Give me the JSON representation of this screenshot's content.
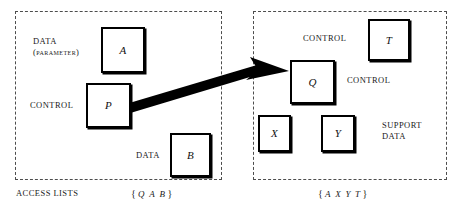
{
  "figure": {
    "title": "",
    "background_color": "#ffffff",
    "line_color": "#000000",
    "panel_border_color": "#4d4d4d",
    "arrow_color": "#000000"
  },
  "panels": [
    {
      "id": "left-domain",
      "footer_label": "ACCESS LISTS",
      "set_braces": {
        "open": "{",
        "close": "}"
      },
      "set_members": [
        "Q",
        "A",
        "B"
      ],
      "captions": [
        {
          "id": "data-parameter",
          "text": "DATA\n(parameter)"
        },
        {
          "id": "control-left",
          "text": "CONTROL"
        },
        {
          "id": "data-left",
          "text": "DATA"
        }
      ],
      "boxes": [
        {
          "id": "box-a",
          "label": "A"
        },
        {
          "id": "box-p",
          "label": "P"
        },
        {
          "id": "box-b",
          "label": "B"
        }
      ]
    },
    {
      "id": "right-domain",
      "footer_label": "",
      "set_braces": {
        "open": "{",
        "close": "}"
      },
      "set_members": [
        "A",
        "X",
        "Y",
        "T"
      ],
      "captions": [
        {
          "id": "control-top-right",
          "text": "CONTROL"
        },
        {
          "id": "control-mid-right",
          "text": "CONTROL"
        },
        {
          "id": "support-data",
          "text": "SUPPORT\nDATA"
        }
      ],
      "boxes": [
        {
          "id": "box-t",
          "label": "T"
        },
        {
          "id": "box-q",
          "label": "Q"
        },
        {
          "id": "box-x",
          "label": "X"
        },
        {
          "id": "box-y",
          "label": "Y"
        }
      ]
    }
  ],
  "arrow": {
    "id": "transfer-arrow",
    "from_box": "P",
    "to_box": "Q",
    "label": ""
  }
}
